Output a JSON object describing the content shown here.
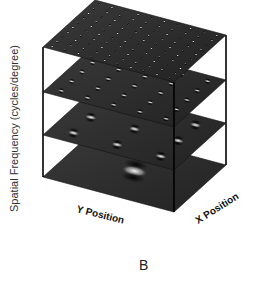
{
  "figure": {
    "panel_label": "B",
    "y_axis_label": "Spatial Frequency (cycles/degree)",
    "x_axis_bottom_left_label": "Y Position",
    "x_axis_bottom_right_label": "X Position"
  },
  "layers": [
    {
      "name": "top",
      "grid": 10,
      "blob_scale": 0.35
    },
    {
      "name": "second",
      "grid": 5,
      "blob_scale": 0.8
    },
    {
      "name": "third",
      "grid": 3,
      "blob_scale": 1.4
    },
    {
      "name": "bottom",
      "grid": 1,
      "blob_scale": 3.2
    }
  ],
  "colors": {
    "plane": "#2a2a2a",
    "frame": "#000000",
    "blob_light": "#f4f4f4",
    "blob_dark": "#0a0a0a"
  }
}
